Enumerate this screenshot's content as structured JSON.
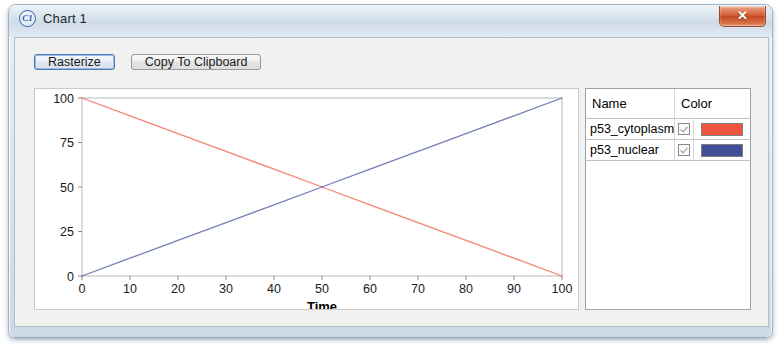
{
  "window": {
    "title": "Chart 1",
    "icon": "c1-logo-icon",
    "close_label": "✕"
  },
  "toolbar": {
    "rasterize_label": "Rasterize",
    "copy_label": "Copy To Clipboard"
  },
  "legend": {
    "columns": [
      "Name",
      "Color"
    ],
    "rows": [
      {
        "name": "p53_cytoplasm",
        "checked": true,
        "color": "#F0563F"
      },
      {
        "name": "p53_nuclear",
        "checked": true,
        "color": "#3F4E96"
      }
    ]
  },
  "chart_data": {
    "type": "line",
    "title": "",
    "xlabel": "Time",
    "ylabel": "",
    "xlim": [
      0,
      100
    ],
    "ylim": [
      0,
      100
    ],
    "xticks": [
      0,
      10,
      20,
      30,
      40,
      50,
      60,
      70,
      80,
      90,
      100
    ],
    "yticks": [
      0,
      25,
      50,
      75,
      100
    ],
    "grid": false,
    "legend_position": "right-panel",
    "series": [
      {
        "name": "p53_cytoplasm",
        "color": "#F0563F",
        "x": [
          0,
          10,
          20,
          30,
          40,
          50,
          60,
          70,
          80,
          90,
          100
        ],
        "values": [
          100,
          90,
          80,
          70,
          60,
          50,
          40,
          30,
          20,
          10,
          0
        ]
      },
      {
        "name": "p53_nuclear",
        "color": "#3F4E96",
        "x": [
          0,
          10,
          20,
          30,
          40,
          50,
          60,
          70,
          80,
          90,
          100
        ],
        "values": [
          0,
          10,
          20,
          30,
          40,
          50,
          60,
          70,
          80,
          90,
          100
        ]
      }
    ]
  }
}
